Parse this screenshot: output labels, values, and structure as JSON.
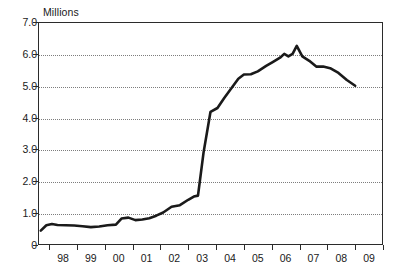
{
  "axis": {
    "unit_label": "Millions",
    "y_ticks": [
      "0",
      "1.0",
      "2.0",
      "3.0",
      "4.0",
      "5.0",
      "6.0",
      "7.0"
    ],
    "y_tick_values": [
      0,
      1,
      2,
      3,
      4,
      5,
      6,
      7
    ],
    "x_ticks": [
      "98",
      "99",
      "00",
      "01",
      "02",
      "03",
      "04",
      "05",
      "06",
      "07",
      "08",
      "09"
    ]
  },
  "style": {
    "line_color": "#1a1a1a",
    "grid_color": "#7d7d7d",
    "frame_color": "#2b2b2b",
    "background": "#ffffff",
    "line_width": 2.6
  },
  "chart_data": {
    "type": "line",
    "title": "",
    "subtitle": "",
    "xlabel": "",
    "ylabel": "Millions",
    "xlim": [
      1997.6,
      2010.0
    ],
    "ylim": [
      0,
      7.0
    ],
    "grid": true,
    "grid_axis": "y",
    "legend": false,
    "legend_position": "none",
    "y_tick_interval": 1.0,
    "x_tick_labels": [
      "98",
      "99",
      "00",
      "01",
      "02",
      "03",
      "04",
      "05",
      "06",
      "07",
      "08",
      "09"
    ],
    "y_tick_labels": [
      "0",
      "1.0",
      "2.0",
      "3.0",
      "4.0",
      "5.0",
      "6.0",
      "7.0"
    ],
    "annotations": [],
    "series": [
      {
        "name": "value",
        "x": [
          1997.7,
          1997.9,
          1998.1,
          1998.3,
          1998.6,
          1998.9,
          1999.2,
          1999.5,
          1999.8,
          2000.1,
          2000.4,
          2000.6,
          2000.85,
          2001.1,
          2001.35,
          2001.6,
          2001.85,
          2002.1,
          2002.4,
          2002.7,
          2003.0,
          2003.2,
          2003.35,
          2003.55,
          2003.8,
          2004.05,
          2004.3,
          2004.55,
          2004.8,
          2005.0,
          2005.25,
          2005.5,
          2005.8,
          2006.05,
          2006.3,
          2006.45,
          2006.6,
          2006.75,
          2006.9,
          2007.1,
          2007.35,
          2007.6,
          2007.85,
          2008.1,
          2008.4,
          2008.7,
          2009.0
        ],
        "y": [
          0.45,
          0.62,
          0.66,
          0.63,
          0.62,
          0.61,
          0.59,
          0.56,
          0.58,
          0.62,
          0.64,
          0.83,
          0.86,
          0.78,
          0.8,
          0.84,
          0.92,
          1.02,
          1.2,
          1.25,
          1.42,
          1.52,
          1.55,
          2.9,
          4.18,
          4.3,
          4.62,
          4.92,
          5.22,
          5.35,
          5.36,
          5.45,
          5.62,
          5.75,
          5.88,
          6.0,
          5.92,
          6.0,
          6.25,
          5.92,
          5.78,
          5.6,
          5.6,
          5.55,
          5.4,
          5.18,
          5.0
        ]
      }
    ]
  }
}
